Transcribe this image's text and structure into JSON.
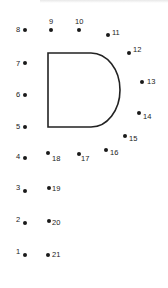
{
  "worksheet": {
    "type": "connect-the-dots",
    "shape_hint": "D",
    "line_color": "#222222",
    "dots": [
      {
        "n": "1",
        "x": 25,
        "y": 255,
        "lx": 16,
        "ly": 248
      },
      {
        "n": "2",
        "x": 25,
        "y": 223,
        "lx": 16,
        "ly": 216
      },
      {
        "n": "3",
        "x": 25,
        "y": 191,
        "lx": 16,
        "ly": 184
      },
      {
        "n": "4",
        "x": 25,
        "y": 158,
        "lx": 16,
        "ly": 153
      },
      {
        "n": "5",
        "x": 25,
        "y": 127,
        "lx": 16,
        "ly": 123
      },
      {
        "n": "6",
        "x": 25,
        "y": 95,
        "lx": 16,
        "ly": 91
      },
      {
        "n": "7",
        "x": 25,
        "y": 63,
        "lx": 16,
        "ly": 60
      },
      {
        "n": "8",
        "x": 25,
        "y": 30,
        "lx": 16,
        "ly": 26
      },
      {
        "n": "9",
        "x": 51,
        "y": 30,
        "lx": 49,
        "ly": 18
      },
      {
        "n": "10",
        "x": 79,
        "y": 30,
        "lx": 75,
        "ly": 18
      },
      {
        "n": "11",
        "x": 108,
        "y": 35,
        "lx": 112,
        "ly": 29
      },
      {
        "n": "12",
        "x": 129,
        "y": 53,
        "lx": 133,
        "ly": 46
      },
      {
        "n": "13",
        "x": 142,
        "y": 82,
        "lx": 147,
        "ly": 78
      },
      {
        "n": "14",
        "x": 139,
        "y": 113,
        "lx": 143,
        "ly": 113
      },
      {
        "n": "15",
        "x": 125,
        "y": 136,
        "lx": 129,
        "ly": 135
      },
      {
        "n": "16",
        "x": 106,
        "y": 150,
        "lx": 110,
        "ly": 149
      },
      {
        "n": "17",
        "x": 79,
        "y": 154,
        "lx": 81,
        "ly": 155
      },
      {
        "n": "18",
        "x": 48,
        "y": 153,
        "lx": 52,
        "ly": 155
      },
      {
        "n": "19",
        "x": 49,
        "y": 188,
        "lx": 52,
        "ly": 185
      },
      {
        "n": "20",
        "x": 49,
        "y": 221,
        "lx": 52,
        "ly": 219
      },
      {
        "n": "21",
        "x": 48,
        "y": 255,
        "lx": 52,
        "ly": 251
      }
    ]
  }
}
